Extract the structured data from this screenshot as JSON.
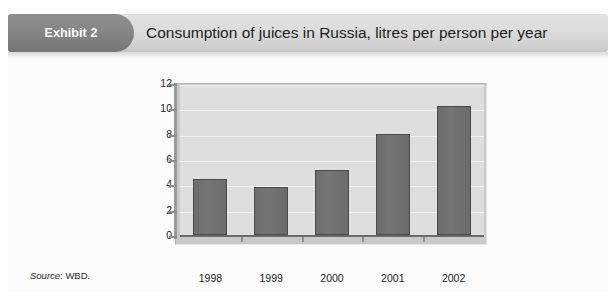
{
  "exhibit": {
    "badge_label": "Exhibit 2",
    "title": "Consumption of juices in Russia, litres per person per year",
    "source_label": "Source",
    "source_value": ": WBD."
  },
  "colors": {
    "badge_background": "#858585",
    "header_background": "#dcdcdc",
    "plot_background": "#dedede",
    "bar_fill": "#6d6d6d",
    "bar_border": "#4a4a4a",
    "gridline": "#f4f4f4",
    "axis": "#8e8e8e",
    "text": "#1d1d1d"
  },
  "chart_data": {
    "type": "bar",
    "title": "Consumption of juices in Russia, litres per person per year",
    "xlabel": "",
    "ylabel": "",
    "categories": [
      "1998",
      "1999",
      "2000",
      "2001",
      "2002"
    ],
    "values": [
      4.4,
      3.8,
      5.1,
      8.0,
      10.2
    ],
    "ylim": [
      0,
      12
    ],
    "ytick_labels": [
      "12",
      "10",
      "8",
      "6",
      "4",
      "2",
      "0"
    ],
    "yticks": [
      12,
      10,
      8,
      6,
      4,
      2,
      0
    ],
    "grid": true,
    "legend": "none",
    "units": "litres per person per year"
  }
}
